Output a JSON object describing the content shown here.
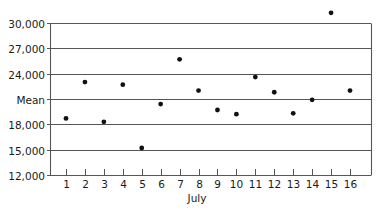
{
  "chart_data": {
    "type": "scatter",
    "title": "",
    "xlabel": "July",
    "ylabel": "",
    "x": [
      1,
      2,
      3,
      4,
      5,
      6,
      7,
      8,
      9,
      10,
      11,
      12,
      13,
      14,
      15,
      16
    ],
    "values": [
      18700,
      23000,
      18300,
      22700,
      15200,
      20400,
      25700,
      22000,
      19700,
      19200,
      23600,
      21800,
      19300,
      20900,
      31200,
      22000
    ],
    "ylim": [
      12000,
      30000
    ],
    "xlim": [
      0.2,
      17.1
    ],
    "y_ticks": [
      {
        "value": 30000,
        "label": "30,000"
      },
      {
        "value": 27000,
        "label": "27,000"
      },
      {
        "value": 24000,
        "label": "24,000"
      },
      {
        "value": 21000,
        "label": "Mean"
      },
      {
        "value": 18000,
        "label": "18,000"
      },
      {
        "value": 15000,
        "label": "15,000"
      },
      {
        "value": 12000,
        "label": "12,000"
      }
    ],
    "x_tick_labels": [
      "1",
      "2",
      "3",
      "4",
      "5",
      "6",
      "7",
      "8",
      "9",
      "10",
      "11",
      "12",
      "13",
      "14",
      "15",
      "16"
    ],
    "grid": "horizontal",
    "legend": null,
    "annotations": [
      {
        "text": "Mean",
        "description": "Horizontal gridline labeled Mean at approximately 21,000"
      }
    ]
  },
  "colors": {
    "point": "#111111",
    "grid": "#555555",
    "text": "#1a1a1a",
    "background": "#ffffff"
  }
}
